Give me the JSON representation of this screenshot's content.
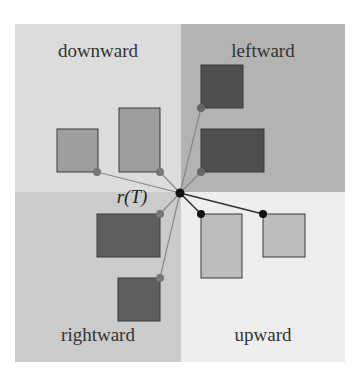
{
  "quadrants": [
    {
      "id": "downward",
      "label": "downward",
      "color": "#dcdcdc",
      "x": 15,
      "y": 24,
      "w": 166,
      "h": 168,
      "lx": 98,
      "ly": 57
    },
    {
      "id": "leftward",
      "label": "leftward",
      "color": "#b3b3b3",
      "x": 181,
      "y": 24,
      "w": 164,
      "h": 168,
      "lx": 263,
      "ly": 57
    },
    {
      "id": "rightward",
      "label": "rightward",
      "color": "#cbcbcb",
      "x": 15,
      "y": 192,
      "w": 166,
      "h": 170,
      "lx": 98,
      "ly": 341
    },
    {
      "id": "upward",
      "label": "upward",
      "color": "#eeeeee",
      "x": 181,
      "y": 192,
      "w": 164,
      "h": 170,
      "lx": 263,
      "ly": 341
    }
  ],
  "root": {
    "label": "r(T)",
    "x": 180,
    "y": 193,
    "lx": 132,
    "ly": 203
  },
  "boxes": [
    {
      "id": "down-1",
      "x": 57,
      "y": 129,
      "w": 41,
      "h": 43,
      "fill": "#9e9e9e",
      "anchor": [
        97,
        172
      ],
      "anchorFill": "#777"
    },
    {
      "id": "down-2",
      "x": 119,
      "y": 108,
      "w": 41,
      "h": 64,
      "fill": "#9e9e9e",
      "anchor": [
        160,
        172
      ],
      "anchorFill": "#777"
    },
    {
      "id": "left-1",
      "x": 201,
      "y": 65,
      "w": 42,
      "h": 43,
      "fill": "#4e4e4e",
      "anchor": [
        201,
        108
      ],
      "anchorFill": "#666"
    },
    {
      "id": "left-2",
      "x": 201,
      "y": 129,
      "w": 63,
      "h": 43,
      "fill": "#4e4e4e",
      "anchor": [
        201,
        172
      ],
      "anchorFill": "#666"
    },
    {
      "id": "right-1",
      "x": 97,
      "y": 214,
      "w": 63,
      "h": 43,
      "fill": "#5e5e5e",
      "anchor": [
        160,
        214
      ],
      "anchorFill": "#777"
    },
    {
      "id": "right-2",
      "x": 118,
      "y": 278,
      "w": 42,
      "h": 43,
      "fill": "#5e5e5e",
      "anchor": [
        160,
        278
      ],
      "anchorFill": "#777"
    },
    {
      "id": "up-1",
      "x": 201,
      "y": 214,
      "w": 41,
      "h": 64,
      "fill": "#bdbdbd",
      "anchor": [
        201,
        214
      ],
      "anchorFill": "#111"
    },
    {
      "id": "up-2",
      "x": 263,
      "y": 214,
      "w": 42,
      "h": 43,
      "fill": "#bdbdbd",
      "anchor": [
        263,
        214
      ],
      "anchorFill": "#111"
    }
  ]
}
